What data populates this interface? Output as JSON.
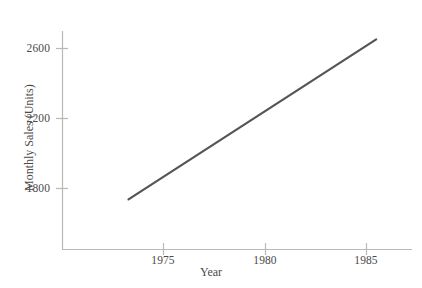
{
  "chart_data": {
    "type": "line",
    "title": "",
    "xlabel": "Year",
    "ylabel": "Monthly Sales (Units)",
    "xlim": [
      1972.0,
      1989.3
    ],
    "ylim": [
      1530,
      2740
    ],
    "xticks": [
      1975,
      1980,
      1985
    ],
    "xtick_labels": [
      "1975",
      "1980",
      "1985"
    ],
    "yticks": [
      1800,
      2200,
      2600
    ],
    "ytick_labels": [
      "1800",
      "2200",
      "2600"
    ],
    "grid": false,
    "legend": null,
    "series": [
      {
        "name": "Monthly Sales",
        "color": "#555555",
        "line_width": 2.2,
        "x": [
          1973.3,
          1985.5
        ],
        "values": [
          1735,
          2650
        ],
        "points": [
          {
            "x": 1973.3,
            "y": 1735
          },
          {
            "x": 1985.5,
            "y": 2650
          }
        ]
      }
    ],
    "annotations": []
  },
  "axes": {
    "axis_color": "#b9b9b9",
    "tick_color": "#b9b9b9",
    "text_color": "#4a4a4a"
  },
  "geometry": {
    "plot_left": 62,
    "plot_right": 412,
    "plot_top": 31,
    "plot_bottom": 250,
    "x_of_1975": 163,
    "x_of_1980": 265,
    "x_of_1985": 366,
    "y_of_2600": 48,
    "y_of_2200": 118,
    "y_of_1800": 188,
    "line_x1": 128,
    "line_y1": 201,
    "line_x2": 374,
    "line_y2": 41
  }
}
